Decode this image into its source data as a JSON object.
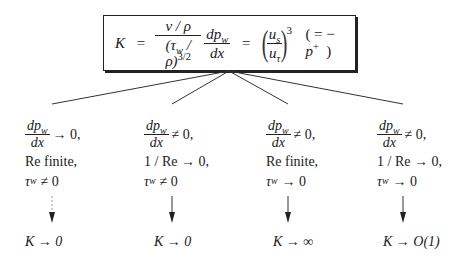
{
  "formula": {
    "lhs": "K",
    "equals": "=",
    "frac1_num": "ν / ρ",
    "frac1_den_tau": "(τ",
    "frac1_den_w": "w",
    "frac1_den_rest": " / ρ)",
    "frac1_den_exp": "3/2",
    "frac2_num_dp": "dp",
    "frac2_num_sub": "w",
    "frac2_den": "dx",
    "equals2": "=",
    "frac3_num": "u",
    "frac3_num_sub": "s",
    "frac3_den": "u",
    "frac3_den_sub": "τ",
    "frac3_exp": "3",
    "aside_open": "( = −",
    "aside_p": "p",
    "aside_sup": "+",
    "aside_close": ")"
  },
  "branches": [
    {
      "grad_num": "dp",
      "grad_sub": "w",
      "grad_den": "dx",
      "grad_rel": "→ 0,",
      "reynolds": "Re finite,",
      "tau_sym": "τ",
      "tau_sub": "w",
      "tau_rel": "≠ 0",
      "arrow_style": "dashed",
      "result": "K → 0"
    },
    {
      "grad_num": "dp",
      "grad_sub": "w",
      "grad_den": "dx",
      "grad_rel": "≠ 0,",
      "reynolds": "1 / Re → 0,",
      "tau_sym": "τ",
      "tau_sub": "w",
      "tau_rel": "≠ 0",
      "arrow_style": "solid",
      "result": "K → 0"
    },
    {
      "grad_num": "dp",
      "grad_sub": "w",
      "grad_den": "dx",
      "grad_rel": "≠ 0,",
      "reynolds": "Re finite,",
      "tau_sym": "τ",
      "tau_sub": "w",
      "tau_rel": "→ 0",
      "arrow_style": "solid",
      "result": "K → ∞"
    },
    {
      "grad_num": "dp",
      "grad_sub": "w",
      "grad_den": "dx",
      "grad_rel": "≠ 0,",
      "reynolds": "1 / Re → 0,",
      "tau_sym": "τ",
      "tau_sub": "w",
      "tau_rel": "→ 0",
      "arrow_style": "solid",
      "result": "K → O(1)"
    }
  ]
}
